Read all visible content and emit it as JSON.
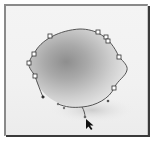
{
  "canvas": {
    "width": 153,
    "height": 144,
    "frame_color": "#3a3a3a",
    "background_color": "#f2f2f2"
  },
  "image": {
    "subject": "lemon",
    "fill_light": "#d9d9d9",
    "fill_dark": "#8e8e8e",
    "shadow_color": "#cfcfcf"
  },
  "path": {
    "tool": "pen-tool-path",
    "stroke_color": "#555555",
    "anchor_points": [
      {
        "x": 50,
        "y": 36
      },
      {
        "x": 98,
        "y": 32
      },
      {
        "x": 106,
        "y": 37
      },
      {
        "x": 108,
        "y": 41
      },
      {
        "x": 119,
        "y": 57
      },
      {
        "x": 114,
        "y": 88
      },
      {
        "x": 35,
        "y": 76
      },
      {
        "x": 29,
        "y": 63
      },
      {
        "x": 34,
        "y": 54
      }
    ],
    "direction_points": [
      {
        "x": 43,
        "y": 97
      },
      {
        "x": 108,
        "y": 101
      },
      {
        "x": 58,
        "y": 104
      },
      {
        "x": 64,
        "y": 108
      },
      {
        "x": 85,
        "y": 117
      }
    ]
  },
  "cursor": {
    "type": "direct-selection-arrow",
    "x": 86,
    "y": 119
  }
}
